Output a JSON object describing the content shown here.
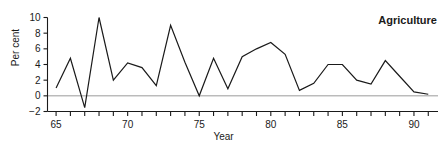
{
  "figure": {
    "clipped_header_text": "",
    "series_label": "Agriculture"
  },
  "chart_data": {
    "type": "line",
    "title": "Agriculture",
    "xlabel": "Year",
    "ylabel": "Per cent",
    "xlim": [
      64.4,
      91.4
    ],
    "ylim": [
      -2,
      10
    ],
    "grid": false,
    "legend": "none",
    "zero_reference_line": true,
    "y_ticks": [
      -2,
      0,
      2,
      4,
      6,
      8,
      10
    ],
    "y_tick_labels": [
      "−2",
      "0",
      "2",
      "4",
      "6",
      "8",
      "10"
    ],
    "x_ticks": [
      65,
      66,
      67,
      68,
      69,
      70,
      71,
      72,
      73,
      74,
      75,
      76,
      77,
      78,
      79,
      80,
      81,
      82,
      83,
      84,
      85,
      86,
      87,
      88,
      89,
      90,
      91
    ],
    "x_tick_labels": [
      {
        "x": 65,
        "label": "65"
      },
      {
        "x": 70,
        "label": "70"
      },
      {
        "x": 75,
        "label": "75"
      },
      {
        "x": 80,
        "label": "80"
      },
      {
        "x": 85,
        "label": "85"
      },
      {
        "x": 90,
        "label": "90"
      }
    ],
    "x": [
      65,
      66,
      67,
      68,
      69,
      70,
      71,
      72,
      73,
      74,
      75,
      76,
      77,
      78,
      79,
      80,
      81,
      82,
      83,
      84,
      85,
      86,
      87,
      88,
      89,
      90,
      91
    ],
    "values": [
      1.0,
      4.8,
      -1.5,
      10.0,
      2.0,
      4.2,
      3.6,
      1.3,
      9.0,
      4.3,
      0.0,
      4.8,
      0.9,
      5.0,
      6.0,
      6.8,
      5.3,
      0.7,
      1.6,
      4.0,
      4.0,
      2.0,
      1.5,
      4.5,
      2.5,
      0.5,
      0.2
    ],
    "series": [
      {
        "name": "Agriculture",
        "color": "#1a1a1a",
        "values": [
          1.0,
          4.8,
          -1.5,
          10.0,
          2.0,
          4.2,
          3.6,
          1.3,
          9.0,
          4.3,
          0.0,
          4.8,
          0.9,
          5.0,
          6.0,
          6.8,
          5.3,
          0.7,
          1.6,
          4.0,
          4.0,
          2.0,
          1.5,
          4.5,
          2.5,
          0.5,
          0.2
        ]
      }
    ]
  },
  "colors": {
    "line": "#1a1a1a",
    "axis": "#1a1a1a",
    "zero_line": "#9a9a9a",
    "background": "#ffffff"
  }
}
